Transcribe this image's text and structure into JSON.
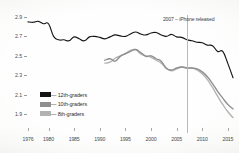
{
  "chart_data": {
    "type": "line",
    "title": "",
    "subtitle": "",
    "xlabel": "",
    "ylabel": "",
    "xlim": [
      1976,
      2016
    ],
    "ylim": [
      1.82,
      2.92
    ],
    "grid": false,
    "legend_position": "bottom-left",
    "y_ticks": [
      "2.9",
      "2.7",
      "2.5",
      "2.3",
      "2.1",
      "1.9"
    ],
    "y_tick_values": [
      2.9,
      2.7,
      2.5,
      2.3,
      2.1,
      1.9
    ],
    "x_ticks": [
      "1976",
      "1980",
      "1985",
      "1990",
      "1995",
      "2000",
      "2005",
      "2010",
      "2015"
    ],
    "x_tick_values": [
      1976,
      1980,
      1985,
      1990,
      1995,
      2000,
      2005,
      2010,
      2015
    ],
    "annotations": [
      {
        "name": "iphone-release-marker",
        "label": "2007 – iPhone released",
        "x": 2007,
        "type": "vline",
        "color": "#b9b9b9"
      }
    ],
    "series": [
      {
        "name": "12th-graders",
        "legend_label": "— 12th-graders",
        "color": "#141414",
        "x": [
          1976,
          1977,
          1978,
          1979,
          1980,
          1981,
          1982,
          1983,
          1984,
          1985,
          1986,
          1987,
          1988,
          1989,
          1990,
          1991,
          1992,
          1993,
          1994,
          1995,
          1996,
          1997,
          1998,
          1999,
          2000,
          2001,
          2002,
          2003,
          2004,
          2005,
          2006,
          2007,
          2008,
          2009,
          2010,
          2011,
          2012,
          2013,
          2014,
          2015,
          2016
        ],
        "values": [
          2.85,
          2.845,
          2.855,
          2.83,
          2.83,
          2.7,
          2.665,
          2.665,
          2.655,
          2.695,
          2.675,
          2.655,
          2.695,
          2.7,
          2.69,
          2.675,
          2.695,
          2.715,
          2.705,
          2.7,
          2.725,
          2.745,
          2.725,
          2.715,
          2.735,
          2.74,
          2.715,
          2.7,
          2.72,
          2.695,
          2.69,
          2.665,
          2.655,
          2.64,
          2.635,
          2.61,
          2.605,
          2.545,
          2.545,
          2.42,
          2.275
        ]
      },
      {
        "name": "10th-graders",
        "legend_label": "— 10th-graders",
        "color": "#8f8f8f",
        "x": [
          1991,
          1992,
          1993,
          1994,
          1995,
          1996,
          1997,
          1998,
          1999,
          2000,
          2001,
          2002,
          2003,
          2004,
          2005,
          2006,
          2007,
          2008,
          2009,
          2010,
          2011,
          2012,
          2013,
          2014,
          2015,
          2016
        ],
        "values": [
          2.455,
          2.47,
          2.445,
          2.495,
          2.52,
          2.545,
          2.565,
          2.535,
          2.495,
          2.5,
          2.47,
          2.445,
          2.37,
          2.355,
          2.375,
          2.385,
          2.375,
          2.375,
          2.365,
          2.335,
          2.285,
          2.215,
          2.135,
          2.065,
          2.0,
          1.955
        ]
      },
      {
        "name": "8th-graders",
        "legend_label": "— 8th-graders",
        "color": "#b2b2b2",
        "x": [
          1991,
          1992,
          1993,
          1994,
          1995,
          1996,
          1997,
          1998,
          1999,
          2000,
          2001,
          2002,
          2003,
          2004,
          2005,
          2006,
          2007,
          2008,
          2009,
          2010,
          2011,
          2012,
          2013,
          2014,
          2015,
          2016
        ],
        "values": [
          2.425,
          2.435,
          2.475,
          2.5,
          2.525,
          2.555,
          2.565,
          2.52,
          2.5,
          2.485,
          2.455,
          2.425,
          2.375,
          2.345,
          2.365,
          2.385,
          2.375,
          2.375,
          2.355,
          2.315,
          2.255,
          2.175,
          2.085,
          2.0,
          1.925,
          1.865
        ]
      }
    ]
  },
  "legend": {
    "items": [
      {
        "label": "— 12th-graders",
        "color": "#141414"
      },
      {
        "label": "— 10th-graders",
        "color": "#8f8f8f"
      },
      {
        "label": "— 8th-graders",
        "color": "#b2b2b2"
      }
    ]
  }
}
